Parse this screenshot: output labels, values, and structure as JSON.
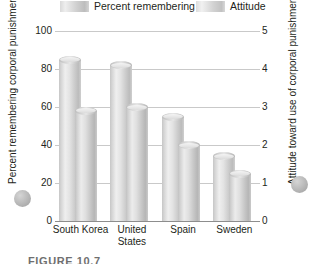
{
  "chart_data": {
    "type": "bar",
    "title": "",
    "categories": [
      "South Korea",
      "United States",
      "Spain",
      "Sweden"
    ],
    "series": [
      {
        "name": "Percent remembering",
        "axis": "left",
        "values": [
          85,
          82,
          55,
          34
        ]
      },
      {
        "name": "Attitude",
        "axis": "right",
        "values": [
          2.9,
          3.0,
          2.0,
          1.25
        ]
      }
    ],
    "left_axis": {
      "label": "Percent remembering corporal punishment as a child",
      "ticks": [
        "0",
        "20",
        "40",
        "60",
        "80",
        "100"
      ],
      "ylim": [
        0,
        100
      ]
    },
    "right_axis": {
      "label": "Attitude toward use of corporal punishment",
      "ticks": [
        "0",
        "1",
        "2",
        "3",
        "4",
        "5"
      ],
      "ylim": [
        0,
        5
      ]
    },
    "grid": true,
    "legend_position": "top"
  },
  "legend": {
    "entries": [
      {
        "label": "Percent remembering"
      },
      {
        "label": "Attitude"
      }
    ]
  },
  "caption": "FIGURE 10.7"
}
